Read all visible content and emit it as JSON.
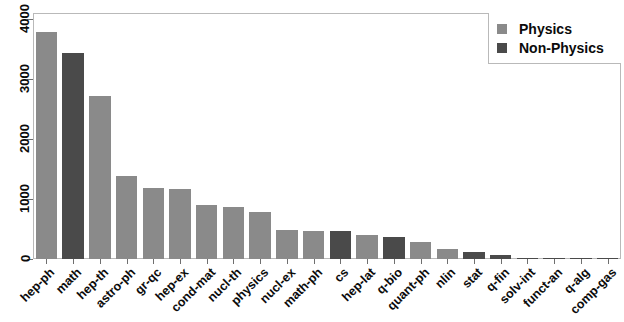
{
  "chart_data": {
    "type": "bar",
    "title": "",
    "subtitle": "",
    "xlabel": "",
    "ylabel": "",
    "grid": false,
    "ylim": [
      0,
      4100
    ],
    "yticks": [
      0,
      1000,
      2000,
      3000,
      4000
    ],
    "ytick_labels": [
      "0",
      "1000",
      "2000",
      "3000",
      "4000"
    ],
    "legend_position": "top-right",
    "categories": [
      "hep-ph",
      "math",
      "hep-th",
      "astro-ph",
      "gr-qc",
      "hep-ex",
      "cond-mat",
      "nucl-th",
      "physics",
      "nucl-ex",
      "math-ph",
      "cs",
      "hep-lat",
      "q-bio",
      "quant-ph",
      "nlin",
      "stat",
      "q-fin",
      "solv-int",
      "funct-an",
      "q-alg",
      "comp-gas"
    ],
    "values": [
      3790,
      3440,
      2710,
      1390,
      1180,
      1170,
      900,
      860,
      790,
      480,
      465,
      460,
      400,
      370,
      280,
      175,
      110,
      60,
      20,
      8,
      5,
      3
    ],
    "groups": [
      "Physics",
      "Non-Physics",
      "Physics",
      "Physics",
      "Physics",
      "Physics",
      "Physics",
      "Physics",
      "Physics",
      "Physics",
      "Physics",
      "Non-Physics",
      "Physics",
      "Non-Physics",
      "Physics",
      "Physics",
      "Non-Physics",
      "Non-Physics",
      "Non-Physics",
      "Non-Physics",
      "Non-Physics",
      "Non-Physics"
    ],
    "series": [
      {
        "name": "Physics",
        "color": "#8a8a8a"
      },
      {
        "name": "Non-Physics",
        "color": "#4a4a4a"
      }
    ]
  },
  "legend": {
    "items": [
      {
        "label": "Physics",
        "color": "#8a8a8a",
        "swatch": "square-swatch"
      },
      {
        "label": "Non-Physics",
        "color": "#4a4a4a",
        "swatch": "square-swatch"
      }
    ]
  },
  "colors": {
    "physics": "#8a8a8a",
    "non_physics": "#4a4a4a",
    "axis": "#6f6f6f",
    "frame": "#b9b9b9",
    "text": "#0b0b0b",
    "background": "#ffffff"
  }
}
